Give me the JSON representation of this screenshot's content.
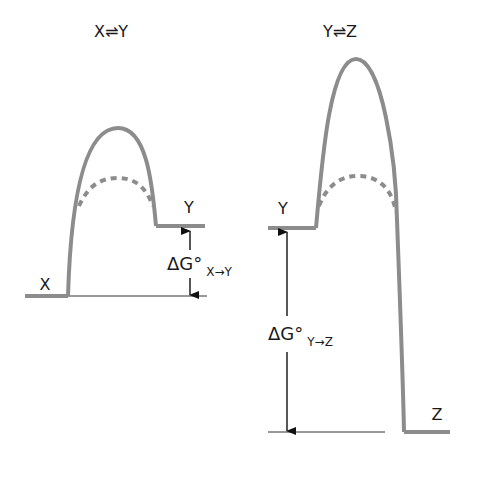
{
  "title_left": "X⇌Y",
  "title_right": "Y⇌Z",
  "left_panel": {
    "state_start": "X",
    "state_end": "Y",
    "delta_g_symbol": "ΔG°",
    "delta_g_subscript": "X→Y"
  },
  "right_panel": {
    "state_start": "Y",
    "state_end": "Z",
    "delta_g_symbol": "ΔG°",
    "delta_g_subscript": "Y→Z"
  },
  "colors": {
    "curve": "#8c8c8c",
    "line": "#333333",
    "text": "#1a1a1a"
  }
}
